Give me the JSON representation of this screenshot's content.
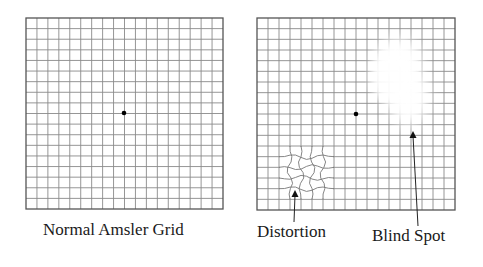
{
  "figure": {
    "panels": [
      {
        "id": "normal",
        "caption": "Normal Amsler Grid",
        "grid": {
          "x": 26,
          "y": 18,
          "width": 197,
          "height": 191,
          "cols": 18,
          "rows": 18
        },
        "fixation_dot": {
          "x": 124,
          "y": 113
        }
      },
      {
        "id": "abnormal",
        "grid": {
          "x": 257,
          "y": 18,
          "width": 198,
          "height": 192,
          "cols": 18,
          "rows": 18
        },
        "fixation_dot": {
          "x": 356,
          "y": 114
        },
        "annotations": [
          {
            "label": "Distortion",
            "arrow_tip": {
              "x": 295,
              "y": 190
            },
            "arrow_tail": {
              "x": 294,
              "y": 222
            }
          },
          {
            "label": "Blind Spot",
            "arrow_tip": {
              "x": 413,
              "y": 131
            },
            "arrow_tail": {
              "x": 418,
              "y": 226
            }
          }
        ]
      }
    ],
    "colors": {
      "grid_line": "#8a8a8a",
      "border": "#555555",
      "dot": "#000000",
      "text": "#1a1a1a"
    }
  }
}
